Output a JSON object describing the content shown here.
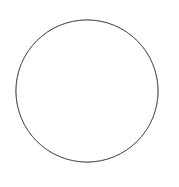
{
  "figure": {
    "title": "",
    "background_color": "#ffffff",
    "width": 179,
    "height": 187
  },
  "chart_data": {
    "type": "scatter",
    "title": "",
    "subtitle": "",
    "xlabel": "",
    "ylabel": "",
    "grid": false,
    "legend": null,
    "axes_visible": false,
    "tick_labels": [],
    "annotations": [],
    "boundary": {
      "shape": "circle",
      "center_x": 87,
      "center_y": 91,
      "radius": 71,
      "stroke_color": "#4a4a4a",
      "stroke_width": 0.9,
      "fill_color": "#ffffff"
    },
    "point_style": {
      "marker": "circle",
      "blur_px": 1.1,
      "color_scale": "grayscale",
      "darkest_color": "#1a1a1a",
      "lightest_color": "#dadada"
    },
    "xlim": [
      16,
      158
    ],
    "ylim": [
      20,
      162
    ],
    "point_count": 158,
    "clusters": [
      {
        "name": "dense-dark-cluster-upper-left",
        "center_x": 58,
        "center_y": 40,
        "darkness": "high"
      },
      {
        "name": "linear-track-upper-right",
        "start_x": 86,
        "start_y": 74,
        "end_x": 153,
        "end_y": 54,
        "darkness": "high"
      },
      {
        "name": "mid-cluster",
        "center_x": 76,
        "center_y": 88,
        "darkness": "medium"
      },
      {
        "name": "right-cluster",
        "center_x": 140,
        "center_y": 86,
        "darkness": "low"
      }
    ],
    "points": [
      {
        "x": 52,
        "y": 27,
        "r": 3.1,
        "v": 0.18
      },
      {
        "x": 57,
        "y": 29,
        "r": 3.4,
        "v": 0.1
      },
      {
        "x": 61,
        "y": 32,
        "r": 3.0,
        "v": 0.16
      },
      {
        "x": 55,
        "y": 33,
        "r": 3.6,
        "v": 0.08
      },
      {
        "x": 59,
        "y": 36,
        "r": 3.2,
        "v": 0.12
      },
      {
        "x": 63,
        "y": 38,
        "r": 2.9,
        "v": 0.22
      },
      {
        "x": 57,
        "y": 39,
        "r": 3.3,
        "v": 0.14
      },
      {
        "x": 53,
        "y": 37,
        "r": 2.8,
        "v": 0.3
      },
      {
        "x": 60,
        "y": 42,
        "r": 3.1,
        "v": 0.2
      },
      {
        "x": 64,
        "y": 44,
        "r": 3.4,
        "v": 0.26
      },
      {
        "x": 58,
        "y": 45,
        "r": 3.0,
        "v": 0.34
      },
      {
        "x": 66,
        "y": 47,
        "r": 2.9,
        "v": 0.4
      },
      {
        "x": 62,
        "y": 49,
        "r": 3.2,
        "v": 0.36
      },
      {
        "x": 68,
        "y": 51,
        "r": 3.5,
        "v": 0.44
      },
      {
        "x": 48,
        "y": 31,
        "r": 2.8,
        "v": 0.46
      },
      {
        "x": 46,
        "y": 38,
        "r": 3.0,
        "v": 0.52
      },
      {
        "x": 50,
        "y": 44,
        "r": 3.3,
        "v": 0.48
      },
      {
        "x": 44,
        "y": 27,
        "r": 2.7,
        "v": 0.6
      },
      {
        "x": 69,
        "y": 30,
        "r": 3.1,
        "v": 0.58
      },
      {
        "x": 72,
        "y": 37,
        "r": 3.4,
        "v": 0.5
      },
      {
        "x": 76,
        "y": 28,
        "r": 3.0,
        "v": 0.66
      },
      {
        "x": 81,
        "y": 24,
        "r": 3.3,
        "v": 0.62
      },
      {
        "x": 88,
        "y": 26,
        "r": 2.9,
        "v": 0.7
      },
      {
        "x": 95,
        "y": 23,
        "r": 3.2,
        "v": 0.64
      },
      {
        "x": 101,
        "y": 29,
        "r": 3.5,
        "v": 0.58
      },
      {
        "x": 108,
        "y": 26,
        "r": 3.0,
        "v": 0.68
      },
      {
        "x": 114,
        "y": 33,
        "r": 3.2,
        "v": 0.6
      },
      {
        "x": 120,
        "y": 29,
        "r": 2.8,
        "v": 0.72
      },
      {
        "x": 126,
        "y": 36,
        "r": 3.1,
        "v": 0.66
      },
      {
        "x": 132,
        "y": 42,
        "r": 3.3,
        "v": 0.7
      },
      {
        "x": 99,
        "y": 37,
        "r": 3.0,
        "v": 0.56
      },
      {
        "x": 93,
        "y": 42,
        "r": 3.2,
        "v": 0.62
      },
      {
        "x": 86,
        "y": 38,
        "r": 2.9,
        "v": 0.68
      },
      {
        "x": 104,
        "y": 45,
        "r": 3.4,
        "v": 0.54
      },
      {
        "x": 111,
        "y": 48,
        "r": 3.0,
        "v": 0.64
      },
      {
        "x": 118,
        "y": 44,
        "r": 3.2,
        "v": 0.7
      },
      {
        "x": 124,
        "y": 50,
        "r": 2.9,
        "v": 0.66
      },
      {
        "x": 86,
        "y": 74,
        "r": 3.0,
        "v": 0.24
      },
      {
        "x": 90,
        "y": 73,
        "r": 3.2,
        "v": 0.16
      },
      {
        "x": 94,
        "y": 72,
        "r": 3.0,
        "v": 0.12
      },
      {
        "x": 98,
        "y": 70,
        "r": 3.1,
        "v": 0.18
      },
      {
        "x": 102,
        "y": 69,
        "r": 3.0,
        "v": 0.14
      },
      {
        "x": 106,
        "y": 67,
        "r": 3.2,
        "v": 0.2
      },
      {
        "x": 110,
        "y": 66,
        "r": 3.0,
        "v": 0.16
      },
      {
        "x": 114,
        "y": 64,
        "r": 3.1,
        "v": 0.22
      },
      {
        "x": 118,
        "y": 63,
        "r": 3.0,
        "v": 0.18
      },
      {
        "x": 122,
        "y": 61,
        "r": 3.2,
        "v": 0.14
      },
      {
        "x": 126,
        "y": 60,
        "r": 3.0,
        "v": 0.2
      },
      {
        "x": 130,
        "y": 59,
        "r": 3.1,
        "v": 0.16
      },
      {
        "x": 134,
        "y": 57,
        "r": 3.0,
        "v": 0.12
      },
      {
        "x": 138,
        "y": 56,
        "r": 3.1,
        "v": 0.14
      },
      {
        "x": 142,
        "y": 55,
        "r": 3.0,
        "v": 0.1
      },
      {
        "x": 146,
        "y": 54,
        "r": 3.0,
        "v": 0.12
      },
      {
        "x": 150,
        "y": 53,
        "r": 2.9,
        "v": 0.16
      },
      {
        "x": 153,
        "y": 52,
        "r": 2.7,
        "v": 0.22
      },
      {
        "x": 82,
        "y": 77,
        "r": 3.0,
        "v": 0.44
      },
      {
        "x": 78,
        "y": 79,
        "r": 3.2,
        "v": 0.5
      },
      {
        "x": 73,
        "y": 76,
        "r": 3.0,
        "v": 0.56
      },
      {
        "x": 70,
        "y": 70,
        "r": 3.3,
        "v": 0.48
      },
      {
        "x": 66,
        "y": 64,
        "r": 3.1,
        "v": 0.52
      },
      {
        "x": 72,
        "y": 61,
        "r": 2.9,
        "v": 0.58
      },
      {
        "x": 77,
        "y": 58,
        "r": 3.2,
        "v": 0.62
      },
      {
        "x": 67,
        "y": 56,
        "r": 3.0,
        "v": 0.46
      },
      {
        "x": 62,
        "y": 58,
        "r": 3.4,
        "v": 0.54
      },
      {
        "x": 75,
        "y": 84,
        "r": 3.1,
        "v": 0.28
      },
      {
        "x": 79,
        "y": 88,
        "r": 3.3,
        "v": 0.34
      },
      {
        "x": 72,
        "y": 91,
        "r": 3.0,
        "v": 0.4
      },
      {
        "x": 68,
        "y": 86,
        "r": 3.2,
        "v": 0.46
      },
      {
        "x": 83,
        "y": 92,
        "r": 3.0,
        "v": 0.5
      },
      {
        "x": 76,
        "y": 96,
        "r": 3.3,
        "v": 0.44
      },
      {
        "x": 70,
        "y": 99,
        "r": 3.1,
        "v": 0.38
      },
      {
        "x": 64,
        "y": 94,
        "r": 2.9,
        "v": 0.56
      },
      {
        "x": 87,
        "y": 98,
        "r": 3.2,
        "v": 0.48
      },
      {
        "x": 81,
        "y": 103,
        "r": 3.0,
        "v": 0.42
      },
      {
        "x": 74,
        "y": 106,
        "r": 3.3,
        "v": 0.52
      },
      {
        "x": 67,
        "y": 103,
        "r": 3.1,
        "v": 0.58
      },
      {
        "x": 60,
        "y": 88,
        "r": 3.0,
        "v": 0.62
      },
      {
        "x": 56,
        "y": 95,
        "r": 3.2,
        "v": 0.66
      },
      {
        "x": 62,
        "y": 101,
        "r": 2.9,
        "v": 0.6
      },
      {
        "x": 90,
        "y": 105,
        "r": 3.1,
        "v": 0.56
      },
      {
        "x": 84,
        "y": 110,
        "r": 3.3,
        "v": 0.5
      },
      {
        "x": 77,
        "y": 113,
        "r": 3.0,
        "v": 0.62
      },
      {
        "x": 70,
        "y": 112,
        "r": 3.2,
        "v": 0.68
      },
      {
        "x": 93,
        "y": 88,
        "r": 3.0,
        "v": 0.54
      },
      {
        "x": 98,
        "y": 93,
        "r": 3.2,
        "v": 0.6
      },
      {
        "x": 92,
        "y": 80,
        "r": 2.9,
        "v": 0.64
      },
      {
        "x": 103,
        "y": 84,
        "r": 3.1,
        "v": 0.58
      },
      {
        "x": 108,
        "y": 90,
        "r": 3.3,
        "v": 0.66
      },
      {
        "x": 100,
        "y": 100,
        "r": 3.0,
        "v": 0.62
      },
      {
        "x": 106,
        "y": 104,
        "r": 3.2,
        "v": 0.7
      },
      {
        "x": 95,
        "y": 109,
        "r": 3.0,
        "v": 0.64
      },
      {
        "x": 112,
        "y": 98,
        "r": 3.1,
        "v": 0.68
      },
      {
        "x": 118,
        "y": 92,
        "r": 3.0,
        "v": 0.72
      },
      {
        "x": 124,
        "y": 86,
        "r": 3.2,
        "v": 0.66
      },
      {
        "x": 130,
        "y": 80,
        "r": 3.0,
        "v": 0.7
      },
      {
        "x": 136,
        "y": 74,
        "r": 3.1,
        "v": 0.64
      },
      {
        "x": 141,
        "y": 70,
        "r": 3.0,
        "v": 0.68
      },
      {
        "x": 146,
        "y": 76,
        "r": 3.2,
        "v": 0.72
      },
      {
        "x": 139,
        "y": 82,
        "r": 3.0,
        "v": 0.66
      },
      {
        "x": 133,
        "y": 88,
        "r": 3.1,
        "v": 0.7
      },
      {
        "x": 144,
        "y": 88,
        "r": 3.0,
        "v": 0.74
      },
      {
        "x": 150,
        "y": 82,
        "r": 2.9,
        "v": 0.7
      },
      {
        "x": 147,
        "y": 94,
        "r": 3.1,
        "v": 0.68
      },
      {
        "x": 140,
        "y": 96,
        "r": 3.0,
        "v": 0.72
      },
      {
        "x": 133,
        "y": 98,
        "r": 3.2,
        "v": 0.66
      },
      {
        "x": 127,
        "y": 94,
        "r": 3.0,
        "v": 0.7
      },
      {
        "x": 121,
        "y": 100,
        "r": 3.1,
        "v": 0.74
      },
      {
        "x": 115,
        "y": 106,
        "r": 3.0,
        "v": 0.68
      },
      {
        "x": 126,
        "y": 106,
        "r": 3.2,
        "v": 0.72
      },
      {
        "x": 134,
        "y": 108,
        "r": 3.0,
        "v": 0.76
      },
      {
        "x": 142,
        "y": 104,
        "r": 3.1,
        "v": 0.7
      },
      {
        "x": 149,
        "y": 100,
        "r": 2.9,
        "v": 0.74
      },
      {
        "x": 42,
        "y": 52,
        "r": 3.0,
        "v": 0.68
      },
      {
        "x": 36,
        "y": 60,
        "r": 3.2,
        "v": 0.72
      },
      {
        "x": 30,
        "y": 68,
        "r": 3.0,
        "v": 0.76
      },
      {
        "x": 26,
        "y": 78,
        "r": 3.1,
        "v": 0.74
      },
      {
        "x": 33,
        "y": 84,
        "r": 3.0,
        "v": 0.7
      },
      {
        "x": 40,
        "y": 76,
        "r": 3.2,
        "v": 0.66
      },
      {
        "x": 46,
        "y": 68,
        "r": 3.0,
        "v": 0.72
      },
      {
        "x": 48,
        "y": 82,
        "r": 3.1,
        "v": 0.62
      },
      {
        "x": 42,
        "y": 90,
        "r": 3.0,
        "v": 0.68
      },
      {
        "x": 36,
        "y": 96,
        "r": 3.2,
        "v": 0.74
      },
      {
        "x": 30,
        "y": 90,
        "r": 3.0,
        "v": 0.78
      },
      {
        "x": 52,
        "y": 90,
        "r": 3.1,
        "v": 0.64
      },
      {
        "x": 50,
        "y": 100,
        "r": 3.0,
        "v": 0.7
      },
      {
        "x": 44,
        "y": 104,
        "r": 3.2,
        "v": 0.74
      },
      {
        "x": 56,
        "y": 108,
        "r": 3.0,
        "v": 0.68
      },
      {
        "x": 63,
        "y": 114,
        "r": 3.1,
        "v": 0.72
      },
      {
        "x": 56,
        "y": 118,
        "r": 3.0,
        "v": 0.76
      },
      {
        "x": 48,
        "y": 114,
        "r": 3.2,
        "v": 0.74
      },
      {
        "x": 40,
        "y": 118,
        "r": 3.0,
        "v": 0.78
      },
      {
        "x": 50,
        "y": 126,
        "r": 3.1,
        "v": 0.76
      },
      {
        "x": 58,
        "y": 128,
        "r": 3.0,
        "v": 0.74
      },
      {
        "x": 66,
        "y": 124,
        "r": 3.2,
        "v": 0.72
      },
      {
        "x": 74,
        "y": 122,
        "r": 3.0,
        "v": 0.7
      },
      {
        "x": 82,
        "y": 120,
        "r": 3.1,
        "v": 0.74
      },
      {
        "x": 90,
        "y": 118,
        "r": 3.0,
        "v": 0.72
      },
      {
        "x": 98,
        "y": 122,
        "r": 3.2,
        "v": 0.76
      },
      {
        "x": 106,
        "y": 118,
        "r": 3.0,
        "v": 0.74
      },
      {
        "x": 114,
        "y": 122,
        "r": 3.1,
        "v": 0.78
      },
      {
        "x": 122,
        "y": 116,
        "r": 3.0,
        "v": 0.76
      },
      {
        "x": 100,
        "y": 131,
        "r": 3.0,
        "v": 0.78
      },
      {
        "x": 108,
        "y": 134,
        "r": 3.2,
        "v": 0.8
      },
      {
        "x": 116,
        "y": 130,
        "r": 3.0,
        "v": 0.78
      },
      {
        "x": 124,
        "y": 126,
        "r": 3.1,
        "v": 0.8
      },
      {
        "x": 131,
        "y": 120,
        "r": 3.0,
        "v": 0.78
      },
      {
        "x": 88,
        "y": 136,
        "r": 3.0,
        "v": 0.82
      },
      {
        "x": 78,
        "y": 133,
        "r": 3.1,
        "v": 0.8
      },
      {
        "x": 68,
        "y": 136,
        "r": 3.0,
        "v": 0.82
      },
      {
        "x": 96,
        "y": 142,
        "r": 3.0,
        "v": 0.84
      },
      {
        "x": 110,
        "y": 144,
        "r": 3.1,
        "v": 0.84
      },
      {
        "x": 120,
        "y": 138,
        "r": 3.0,
        "v": 0.82
      },
      {
        "x": 56,
        "y": 140,
        "r": 3.0,
        "v": 0.84
      },
      {
        "x": 44,
        "y": 134,
        "r": 3.1,
        "v": 0.82
      },
      {
        "x": 34,
        "y": 110,
        "r": 3.0,
        "v": 0.8
      },
      {
        "x": 26,
        "y": 100,
        "r": 3.1,
        "v": 0.8
      },
      {
        "x": 138,
        "y": 60,
        "r": 3.0,
        "v": 0.62
      },
      {
        "x": 145,
        "y": 64,
        "r": 3.1,
        "v": 0.68
      },
      {
        "x": 130,
        "y": 68,
        "r": 3.0,
        "v": 0.64
      },
      {
        "x": 123,
        "y": 74,
        "r": 3.2,
        "v": 0.7
      }
    ]
  }
}
